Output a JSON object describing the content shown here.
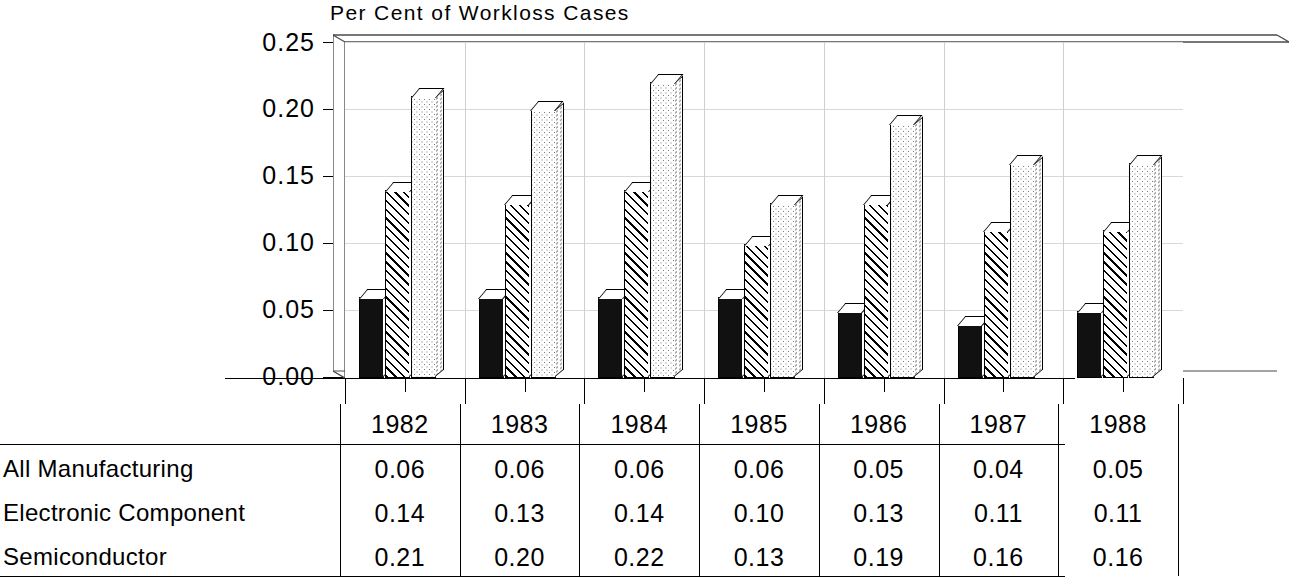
{
  "chart_data": {
    "type": "bar",
    "title": "Per Cent of Workloss Cases",
    "xlabel": "",
    "ylabel": "",
    "ylim": [
      0.0,
      0.25
    ],
    "ytick_labels": [
      "0.25",
      "0.20",
      "0.15",
      "0.10",
      "0.05",
      "0.00"
    ],
    "ytick_values": [
      0.25,
      0.2,
      0.15,
      0.1,
      0.05,
      0.0
    ],
    "grid": true,
    "grid_orientation": "horizontal",
    "legend": "none (values shown in table below)",
    "categories": [
      "1982",
      "1983",
      "1984",
      "1985",
      "1986",
      "1987",
      "1988"
    ],
    "series": [
      {
        "name": "All Manufacturing",
        "fill": "solid-black",
        "values": [
          0.06,
          0.06,
          0.06,
          0.06,
          0.05,
          0.04,
          0.05
        ],
        "labels": [
          "0.06",
          "0.06",
          "0.06",
          "0.06",
          "0.05",
          "0.04",
          "0.05"
        ]
      },
      {
        "name": "Electronic Component",
        "fill": "diagonal-hatch",
        "values": [
          0.14,
          0.13,
          0.14,
          0.1,
          0.13,
          0.11,
          0.11
        ],
        "labels": [
          "0.14",
          "0.13",
          "0.14",
          "0.10",
          "0.13",
          "0.11",
          "0.11"
        ]
      },
      {
        "name": "Semiconductor",
        "fill": "stipple-dots",
        "values": [
          0.21,
          0.2,
          0.22,
          0.13,
          0.19,
          0.16,
          0.16
        ],
        "labels": [
          "0.21",
          "0.20",
          "0.22",
          "0.13",
          "0.19",
          "0.16",
          "0.16"
        ]
      }
    ]
  },
  "table": {
    "corner_label": "",
    "year_headers": [
      "1982",
      "1983",
      "1984",
      "1985",
      "1986",
      "1987",
      "1988"
    ],
    "rows": [
      {
        "label": "All Manufacturing",
        "cells": [
          "0.06",
          "0.06",
          "0.06",
          "0.06",
          "0.05",
          "0.04",
          "0.05"
        ]
      },
      {
        "label": "Electronic Component",
        "cells": [
          "0.14",
          "0.13",
          "0.14",
          "0.10",
          "0.13",
          "0.11",
          "0.11"
        ]
      },
      {
        "label": "Semiconductor",
        "cells": [
          "0.21",
          "0.20",
          "0.22",
          "0.13",
          "0.19",
          "0.16",
          "0.16"
        ]
      }
    ]
  },
  "colors": {
    "background": "#ffffff",
    "ink": "#000000",
    "gridline": "#d8d8d8",
    "series_solid": "#111111",
    "series_hatch": "#ffffff",
    "series_stipple": "#ffffff"
  }
}
